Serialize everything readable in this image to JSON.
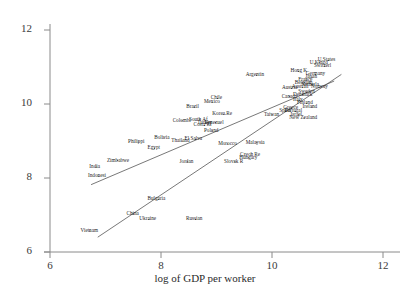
{
  "chart_data": {
    "type": "scatter",
    "title": "",
    "xlabel": "log of GDP per worker",
    "ylabel": "",
    "xlim": [
      6,
      12
    ],
    "ylim": [
      6,
      12
    ],
    "xticks": [
      6,
      8,
      10,
      12
    ],
    "yticks": [
      6,
      8,
      10,
      12
    ],
    "grid": false,
    "legend": "none",
    "axis_color": "#7a7a7a",
    "label_color": "#1c1c1c",
    "line_color": "#555555",
    "points": [
      {
        "label": "Vietnam",
        "x": 6.72,
        "y": 6.57
      },
      {
        "label": "Ukraine",
        "x": 7.78,
        "y": 6.88
      },
      {
        "label": "China",
        "x": 7.5,
        "y": 7.03
      },
      {
        "label": "Russian",
        "x": 8.62,
        "y": 6.88
      },
      {
        "label": "Bulgaria",
        "x": 7.95,
        "y": 7.42
      },
      {
        "label": "Indonesi",
        "x": 6.88,
        "y": 8.05
      },
      {
        "label": "India",
        "x": 6.83,
        "y": 8.3
      },
      {
        "label": "Zimbabwe",
        "x": 7.22,
        "y": 8.47
      },
      {
        "label": "Jordan",
        "x": 8.48,
        "y": 8.44
      },
      {
        "label": "Slovak R",
        "x": 9.33,
        "y": 8.44
      },
      {
        "label": "Czech Re",
        "x": 9.62,
        "y": 8.62
      },
      {
        "label": "Hungary",
        "x": 9.58,
        "y": 8.55
      },
      {
        "label": "Egypt",
        "x": 7.88,
        "y": 8.8
      },
      {
        "label": "Philippi",
        "x": 7.6,
        "y": 8.97
      },
      {
        "label": "Bolivia",
        "x": 8.05,
        "y": 9.08
      },
      {
        "label": "Thailand",
        "x": 8.38,
        "y": 9.0
      },
      {
        "label": "El Salva",
        "x": 8.62,
        "y": 9.05
      },
      {
        "label": "Morocco",
        "x": 9.2,
        "y": 8.92
      },
      {
        "label": "Malaysia",
        "x": 9.72,
        "y": 8.95
      },
      {
        "label": "Poland",
        "x": 8.92,
        "y": 9.28
      },
      {
        "label": "Costa Ri",
        "x": 8.78,
        "y": 9.42
      },
      {
        "label": "Colombi",
        "x": 8.38,
        "y": 9.55
      },
      {
        "label": "South Af",
        "x": 8.7,
        "y": 9.58
      },
      {
        "label": "Turkey",
        "x": 8.8,
        "y": 9.48
      },
      {
        "label": "Venezuel",
        "x": 8.98,
        "y": 9.5
      },
      {
        "label": "Korea.Re",
        "x": 9.12,
        "y": 9.72
      },
      {
        "label": "Brazil",
        "x": 8.6,
        "y": 9.92
      },
      {
        "label": "Mexico",
        "x": 8.92,
        "y": 10.05
      },
      {
        "label": "Chile",
        "x": 9.02,
        "y": 10.15
      },
      {
        "label": "Argentin",
        "x": 9.72,
        "y": 10.78
      },
      {
        "label": "Spain",
        "x": 10.25,
        "y": 9.8
      },
      {
        "label": "Taiwan",
        "x": 10.0,
        "y": 9.7
      },
      {
        "label": "New Zealand",
        "x": 10.58,
        "y": 9.62
      },
      {
        "label": "Israel",
        "x": 10.48,
        "y": 9.7
      },
      {
        "label": "Portugal",
        "x": 10.42,
        "y": 9.8
      },
      {
        "label": "Greece",
        "x": 10.35,
        "y": 9.88
      },
      {
        "label": "Ireland",
        "x": 10.72,
        "y": 9.92
      },
      {
        "label": "Finland",
        "x": 10.62,
        "y": 10.02
      },
      {
        "label": "Italy",
        "x": 10.5,
        "y": 10.1
      },
      {
        "label": "Canada",
        "x": 10.32,
        "y": 10.2
      },
      {
        "label": "Denmark",
        "x": 10.55,
        "y": 10.25
      },
      {
        "label": "Sweden",
        "x": 10.62,
        "y": 10.32
      },
      {
        "label": "Austria",
        "x": 10.35,
        "y": 10.42
      },
      {
        "label": "Australi",
        "x": 10.55,
        "y": 10.45
      },
      {
        "label": "Norway",
        "x": 10.85,
        "y": 10.45
      },
      {
        "label": "Belgium",
        "x": 10.58,
        "y": 10.58
      },
      {
        "label": "Netherla",
        "x": 10.72,
        "y": 10.52
      },
      {
        "label": "France",
        "x": 10.62,
        "y": 10.65
      },
      {
        "label": "Japan",
        "x": 10.72,
        "y": 10.72
      },
      {
        "label": "Germany",
        "x": 10.78,
        "y": 10.8
      },
      {
        "label": "Hong K",
        "x": 10.48,
        "y": 10.88
      },
      {
        "label": "Switzerl",
        "x": 10.95,
        "y": 11.02
      },
      {
        "label": "U.Kingd",
        "x": 10.85,
        "y": 11.12
      },
      {
        "label": "U.States",
        "x": 11.02,
        "y": 11.18
      }
    ],
    "lines": [
      {
        "name": "regression-line-1",
        "x0": 6.74,
        "y0": 7.82,
        "x1": 11.12,
        "y1": 10.62
      },
      {
        "name": "regression-line-2",
        "x0": 6.86,
        "y0": 6.4,
        "x1": 11.25,
        "y1": 10.8
      }
    ]
  }
}
